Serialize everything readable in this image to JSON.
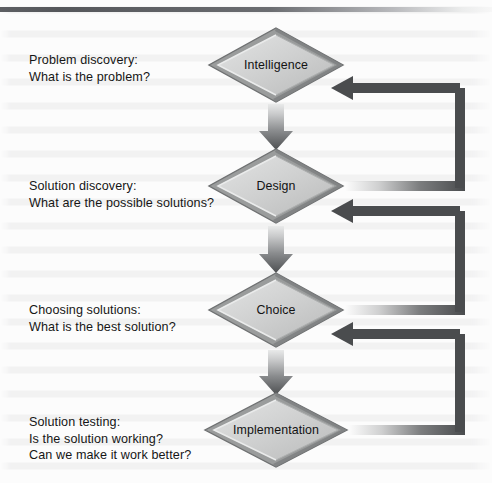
{
  "diagram": {
    "top_rule": true,
    "colors": {
      "node_fill_light": "#d7d8d8",
      "node_fill_mid": "#bfc0c0",
      "node_rim_dark": "#8e9090",
      "node_rim_darkest": "#6f7172",
      "arrow_dark": "#4a4c4e",
      "text": "#161616",
      "page_bg": "#fcfcfc"
    },
    "stages": [
      {
        "id": "intelligence",
        "node_label": "Intelligence",
        "caption_lines": [
          "Problem discovery:",
          "What is the problem?"
        ],
        "node": {
          "cx": 276,
          "cy": 65,
          "rx": 69,
          "ry": 39
        },
        "caption_pos": {
          "x": 29,
          "y": 52
        }
      },
      {
        "id": "design",
        "node_label": "Design",
        "caption_lines": [
          "Solution discovery:",
          "What are the possible solutions?"
        ],
        "node": {
          "cx": 276,
          "cy": 186,
          "rx": 69,
          "ry": 39
        },
        "caption_pos": {
          "x": 29,
          "y": 178
        }
      },
      {
        "id": "choice",
        "node_label": "Choice",
        "caption_lines": [
          "Choosing solutions:",
          "What is the best solution?"
        ],
        "node": {
          "cx": 276,
          "cy": 310,
          "rx": 69,
          "ry": 39
        },
        "caption_pos": {
          "x": 29,
          "y": 302
        }
      },
      {
        "id": "implementation",
        "node_label": "Implementation",
        "caption_lines": [
          "Solution testing:",
          "Is the solution working?",
          "Can we make it work better?"
        ],
        "node": {
          "cx": 276,
          "cy": 430,
          "rx": 73,
          "ry": 39
        },
        "caption_pos": {
          "x": 29,
          "y": 414
        }
      }
    ],
    "forward_arrows": [
      {
        "id": "intelligence-to-design",
        "from": "intelligence",
        "to": "design"
      },
      {
        "id": "design-to-choice",
        "from": "design",
        "to": "choice"
      },
      {
        "id": "choice-to-implementation",
        "from": "choice",
        "to": "implementation"
      }
    ],
    "feedback_loops": [
      {
        "id": "design-to-intelligence",
        "from": "design",
        "to": "intelligence",
        "right_x": 465,
        "from_y": 186,
        "to_y": 88
      },
      {
        "id": "choice-to-design",
        "from": "choice",
        "to": "design",
        "right_x": 465,
        "from_y": 310,
        "to_y": 211
      },
      {
        "id": "implementation-to-choice",
        "from": "implementation",
        "to": "choice",
        "right_x": 465,
        "from_y": 430,
        "to_y": 334
      }
    ]
  }
}
